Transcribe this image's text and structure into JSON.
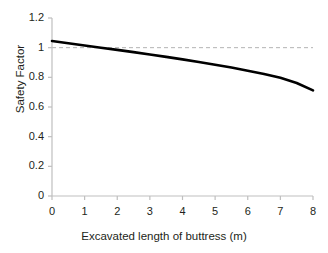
{
  "chart_data": {
    "type": "line",
    "title": "",
    "subtitle": "",
    "xlabel": "Excavated length of buttress (m)",
    "ylabel": "Safety Factor",
    "xlim": [
      0,
      8
    ],
    "ylim": [
      0,
      1.2
    ],
    "xticks": [
      0,
      1,
      2,
      3,
      4,
      5,
      6,
      7,
      8
    ],
    "xtick_labels": [
      "0",
      "1",
      "2",
      "3",
      "4",
      "5",
      "6",
      "7",
      "8"
    ],
    "yticks": [
      0,
      0.2,
      0.4,
      0.6,
      0.8,
      1,
      1.2
    ],
    "ytick_labels": [
      "0",
      "0.2",
      "0.4",
      "0.6",
      "0.8",
      "1",
      "1.2"
    ],
    "grid": false,
    "legend": "none",
    "x": [
      0,
      0.5,
      1,
      1.5,
      2,
      2.5,
      3,
      3.5,
      4,
      4.5,
      5,
      5.5,
      6,
      6.5,
      7,
      7.5,
      8
    ],
    "series": [
      {
        "name": "Safety factor vs excavated length",
        "color": "#000000",
        "line_width": 2.6,
        "values": [
          1.045,
          1.03,
          1.015,
          1.0,
          0.985,
          0.97,
          0.954,
          0.938,
          0.921,
          0.903,
          0.885,
          0.866,
          0.845,
          0.823,
          0.797,
          0.762,
          0.712
        ]
      }
    ],
    "annotations": [
      {
        "type": "hline",
        "name": "unity-safety-factor-reference",
        "y": 1.0,
        "style": "dashed",
        "color": "#b3b3b3",
        "label": ""
      }
    ],
    "axis_color": "#bfbfbf",
    "text_color": "#231f20",
    "background": "#ffffff"
  },
  "plot_geometry": {
    "left": 52,
    "right": 313,
    "top": 18,
    "bottom": 196
  }
}
